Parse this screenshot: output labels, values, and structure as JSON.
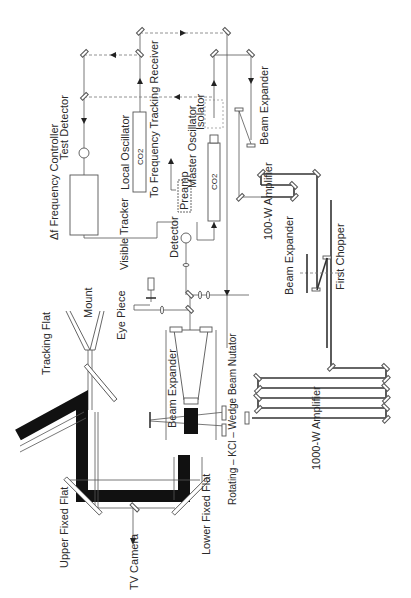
{
  "diagram": {
    "orientation": "rotated 90 degrees counter-clockwise",
    "labels": {
      "test_detector": "Test Detector",
      "delta_f_controller": "Δf Frequency Controller",
      "local_oscillator": "Local Oscillator",
      "local_oscillator_gas": "CO2",
      "to_frequency_tracking": "To Frequency Tracking Receiver",
      "master_oscillator": "Master Oscillator",
      "master_oscillator_gas": "CO2",
      "isolator": "Isolator",
      "preamp": "Preamp",
      "detector": "Detector",
      "visible_tracker": "Visible Tracker",
      "beam_expander_top": "Beam Expander",
      "beam_expander_main": "Beam Expander",
      "beam_expander_chopper": "Beam Expander",
      "first_chopper": "First Chopper",
      "amp_100w": "100-W Amplifier",
      "amp_1000w": "1000-W Amplifier",
      "eye_piece": "Eye Piece",
      "mount": "Mount",
      "tracking_flat": "Tracking Flat",
      "upper_fixed_flat": "Upper Fixed Flat",
      "lower_fixed_flat": "Lower Fixed Flat",
      "tv_camera": "TV Camera",
      "nutator": "Rotating – KCl – Wedge Beam Nutator"
    }
  }
}
